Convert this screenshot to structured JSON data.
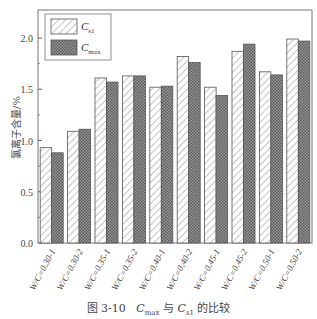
{
  "chart_data": {
    "type": "bar",
    "title": "",
    "caption": {
      "prefix": "图 3-10",
      "a_base": "C",
      "a_sub": "max",
      "mid": "与",
      "b_base": "C",
      "b_sub": "s1",
      "suffix": "的比较"
    },
    "xlabel": "",
    "ylabel": "氯离子含量/%",
    "ylim": [
      0,
      2.2
    ],
    "yticks": [
      0.0,
      0.5,
      1.0,
      1.5,
      2.0
    ],
    "ytick_labels": [
      "0.0",
      "0.5",
      "1.0",
      "1.5",
      "2.0"
    ],
    "grid": false,
    "legend_position": "upper left",
    "categories": [
      "W/C=0.30-1",
      "W/C=0.30-2",
      "W/C=0.35-1",
      "W/C=0.35-2",
      "W/C=0.40-1",
      "W/C=0.40-2",
      "W/C=0.45-1",
      "W/C=0.45-2",
      "W/C=0.50-1",
      "W/C=0.50-2"
    ],
    "series": [
      {
        "name": "C_s1",
        "label_base": "C",
        "label_sub": "s1",
        "pattern": "diagonal-hatch",
        "values": [
          0.93,
          1.09,
          1.61,
          1.63,
          1.52,
          1.82,
          1.52,
          1.87,
          1.67,
          1.99
        ]
      },
      {
        "name": "C_max",
        "label_base": "C",
        "label_sub": "max",
        "pattern": "crosshatch-dark",
        "values": [
          0.88,
          1.11,
          1.57,
          1.63,
          1.53,
          1.76,
          1.44,
          1.94,
          1.64,
          1.97
        ]
      }
    ]
  },
  "colors": {
    "axis": "#555555",
    "hatch": "#777777",
    "cross_fill": "#8a8a8a",
    "text": "#444444"
  }
}
